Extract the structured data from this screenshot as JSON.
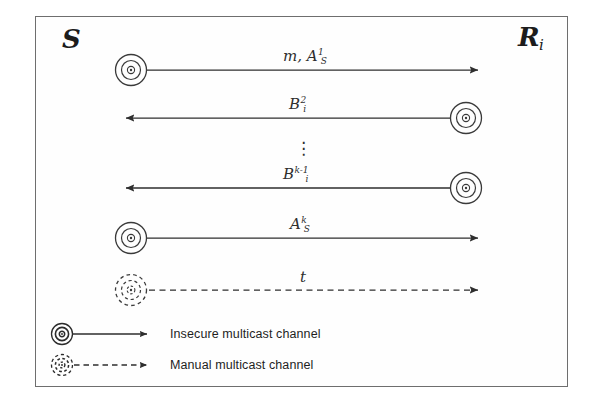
{
  "diagram": {
    "frame": {
      "border_color": "#6e6e6e",
      "background": "#fefefe"
    },
    "ink_color": "#2e2e2e",
    "endpoints": {
      "sender": {
        "name": "S",
        "label": "S",
        "subscript": ""
      },
      "receiver": {
        "name": "R_i",
        "label": "R",
        "subscript": "i"
      }
    },
    "messages": [
      {
        "id": "msg-1",
        "base": "m, A",
        "sub": "S",
        "sup": "1",
        "text": "m, A_S^1",
        "direction": "right",
        "channel": "insecure"
      },
      {
        "id": "msg-2",
        "base": "B",
        "sub": "i",
        "sup": "2",
        "text": "B_i^2",
        "direction": "left",
        "channel": "insecure"
      },
      {
        "id": "msg-3",
        "base": "B",
        "sub": "i",
        "sup": "k-1",
        "text": "B_i^{k-1}",
        "direction": "left",
        "channel": "insecure"
      },
      {
        "id": "msg-4",
        "base": "A",
        "sub": "S",
        "sup": "k",
        "text": "A_S^k",
        "direction": "right",
        "channel": "insecure"
      },
      {
        "id": "msg-5",
        "base": "t",
        "sub": "",
        "sup": "",
        "text": "t",
        "direction": "right",
        "channel": "manual"
      }
    ],
    "ellipsis": "⋮",
    "legend": [
      {
        "icon": "concentric-circles-solid-icon",
        "line": "solid",
        "label": "Insecure multicast channel"
      },
      {
        "icon": "concentric-circles-dashed-icon",
        "line": "dashed",
        "label": "Manual multicast channel"
      }
    ]
  }
}
